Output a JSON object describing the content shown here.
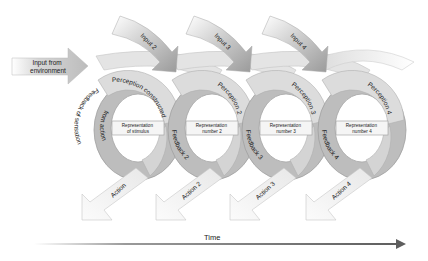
{
  "diagram": {
    "input_from_environment": {
      "line1": "Input from",
      "line2": "environment"
    },
    "inputs": [
      {
        "label": "Input 2"
      },
      {
        "label": "Input 3"
      },
      {
        "label": "Input 4"
      }
    ],
    "loops": [
      {
        "perception": "Perception constructed",
        "feedback_line1": "Feedback of sensation",
        "feedback_line2": "from action",
        "representation_line1": "Representation",
        "representation_line2": "of stimulus",
        "action": "Action"
      },
      {
        "perception": "Perception 2",
        "feedback_line1": "Feedback 2",
        "feedback_line2": "",
        "representation_line1": "Representation",
        "representation_line2": "number 2",
        "action": "Action 2"
      },
      {
        "perception": "Perception 3",
        "feedback_line1": "Feedback 3",
        "feedback_line2": "",
        "representation_line1": "Representation",
        "representation_line2": "number 3",
        "action": "Action 3"
      },
      {
        "perception": "Perception 4",
        "feedback_line1": "Feedback 4",
        "feedback_line2": "",
        "representation_line1": "Representation",
        "representation_line2": "number 4",
        "action": "Action 4"
      }
    ],
    "time_axis": {
      "label": "Time"
    },
    "colors": {
      "ring_dark": "#b4b4b4",
      "ring_light": "#d9d9d9",
      "arc_light": "#e2e2e2",
      "input_arrow": "#9a9a9a",
      "action_arrow": "#f4f4f4",
      "time_arrow": "#6a6a6a"
    }
  }
}
